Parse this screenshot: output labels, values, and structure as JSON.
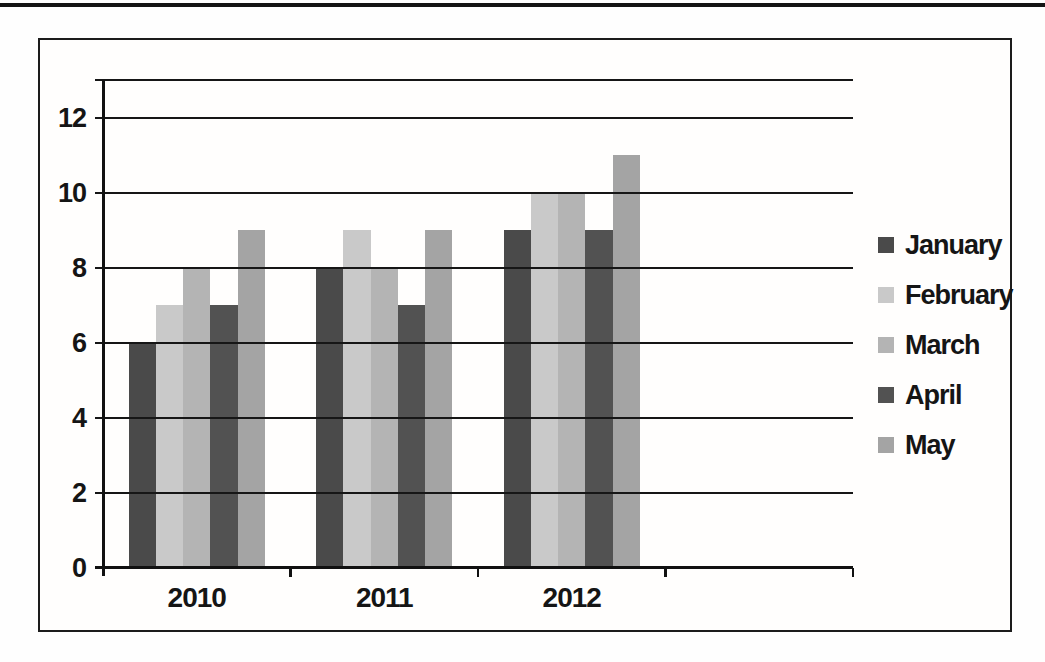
{
  "page": {
    "background": "#fefefe",
    "top_rule_color": "#141414",
    "frame_border_color": "#1c1c1c",
    "axis_color": "#111111",
    "text_color": "#151515"
  },
  "chart_data": {
    "type": "bar",
    "title": "",
    "xlabel": "",
    "ylabel": "",
    "categories": [
      "2010",
      "2011",
      "2012"
    ],
    "series": [
      {
        "name": "January",
        "color": "#4a4a4a",
        "values": [
          6,
          8,
          9
        ]
      },
      {
        "name": "February",
        "color": "#c9c9c9",
        "values": [
          7,
          9,
          10
        ]
      },
      {
        "name": "March",
        "color": "#b4b4b4",
        "values": [
          8,
          8,
          10
        ]
      },
      {
        "name": "April",
        "color": "#525252",
        "values": [
          7,
          7,
          9
        ]
      },
      {
        "name": "May",
        "color": "#a4a4a4",
        "values": [
          9,
          9,
          11
        ]
      }
    ],
    "ylim": [
      0,
      13
    ],
    "ytick_step": 2,
    "ytick_labels": [
      "0",
      "2",
      "4",
      "6",
      "8",
      "10",
      "12"
    ],
    "grid": true,
    "gridlines_over_bars": true,
    "legend_position": "right",
    "num_category_slots": 4
  }
}
